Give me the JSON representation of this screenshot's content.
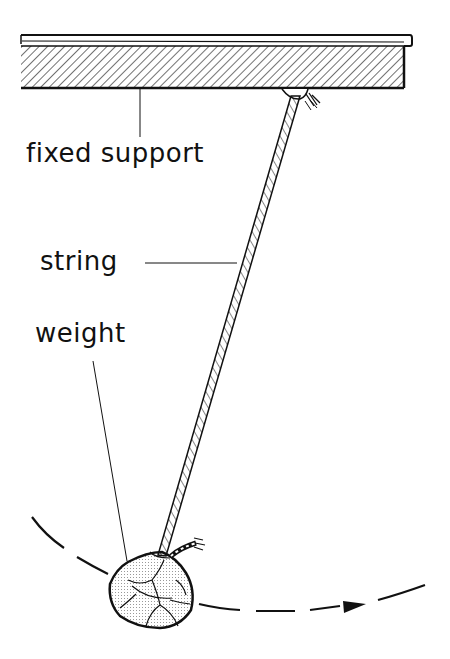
{
  "diagram": {
    "labels": {
      "fixed_support": "fixed support",
      "string": "string",
      "weight": "weight"
    },
    "colors": {
      "ink": "#111111",
      "background": "#ffffff",
      "weight_fill": "#e6e6e6"
    },
    "motion": "dashed arc with arrow indicating swing direction to the right"
  }
}
